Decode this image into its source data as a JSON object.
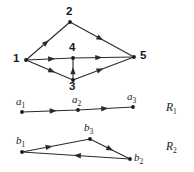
{
  "figure": {
    "background_color": "#ffffff",
    "stroke_color": "#2b2b2b",
    "text_color": "#1a1a1a",
    "width": 194,
    "height": 172
  },
  "main_graph": {
    "name": "main-directed-graph",
    "nodes": [
      {
        "id": "1",
        "label": "1",
        "x": 26,
        "y": 60,
        "label_x": 13,
        "label_y": 53
      },
      {
        "id": "2",
        "label": "2",
        "x": 70,
        "y": 22,
        "label_x": 66,
        "label_y": 6
      },
      {
        "id": "3",
        "label": "3",
        "x": 73,
        "y": 80,
        "label_x": 69,
        "label_y": 81
      },
      {
        "id": "4",
        "label": "4",
        "x": 73,
        "y": 58,
        "label_x": 69,
        "label_y": 42
      },
      {
        "id": "5",
        "label": "5",
        "x": 134,
        "y": 57,
        "label_x": 140,
        "label_y": 50
      }
    ],
    "edges": [
      {
        "from": "1",
        "to": "2",
        "arrow_t": 0.52
      },
      {
        "from": "2",
        "to": "5",
        "arrow_t": 0.52
      },
      {
        "from": "1",
        "to": "4",
        "arrow_t": 0.62
      },
      {
        "from": "4",
        "to": "5",
        "arrow_t": 0.48
      },
      {
        "from": "1",
        "to": "3",
        "arrow_t": 0.62
      },
      {
        "from": "3",
        "to": "5",
        "arrow_t": 0.5
      },
      {
        "from": "3",
        "to": "4",
        "arrow_t": 0.58
      }
    ]
  },
  "route_1": {
    "name": "route-R1",
    "label": "R",
    "label_sub": "1",
    "label_x": 166,
    "label_y": 102,
    "nodes": [
      {
        "id": "a1",
        "label": "a",
        "sub": "1",
        "x": 22,
        "y": 112,
        "label_x": 16,
        "label_y": 96
      },
      {
        "id": "a2",
        "label": "a",
        "sub": "2",
        "x": 78,
        "y": 110,
        "label_x": 72,
        "label_y": 94
      },
      {
        "id": "a3",
        "label": "a",
        "sub": "3",
        "x": 133,
        "y": 107,
        "label_x": 127,
        "label_y": 91
      }
    ],
    "edges": [
      {
        "from": "a1",
        "to": "a2",
        "arrow_t": 0.62
      },
      {
        "from": "a2",
        "to": "a3",
        "arrow_t": 0.55
      }
    ]
  },
  "route_2": {
    "name": "route-R2",
    "label": "R",
    "label_sub": "2",
    "label_x": 166,
    "label_y": 141,
    "nodes": [
      {
        "id": "b1",
        "label": "b",
        "sub": "1",
        "x": 22,
        "y": 152,
        "label_x": 16,
        "label_y": 135
      },
      {
        "id": "b2",
        "label": "b",
        "sub": "2",
        "x": 130,
        "y": 159,
        "label_x": 134,
        "label_y": 152
      },
      {
        "id": "b3",
        "label": "b",
        "sub": "3",
        "x": 90,
        "y": 139,
        "label_x": 84,
        "label_y": 122
      }
    ],
    "edges": [
      {
        "from": "b1",
        "to": "b3",
        "arrow_t": 0.45
      },
      {
        "from": "b3",
        "to": "b2",
        "arrow_t": 0.58
      },
      {
        "from": "b2",
        "to": "b1",
        "arrow_t": 0.52
      }
    ]
  }
}
